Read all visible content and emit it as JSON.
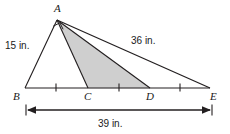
{
  "figure": {
    "type": "geometry-diagram",
    "colors": {
      "stroke": "#231f20",
      "shade_fill": "#cfcfcf",
      "background": "#ffffff",
      "text": "#1a1a1a"
    },
    "vertices": [
      {
        "id": "A",
        "label": "A",
        "x": 57,
        "y": 20
      },
      {
        "id": "B",
        "label": "B",
        "x": 25,
        "y": 88
      },
      {
        "id": "C",
        "label": "C",
        "x": 88,
        "y": 88
      },
      {
        "id": "D",
        "label": "D",
        "x": 150,
        "y": 88
      },
      {
        "id": "E",
        "label": "E",
        "x": 210,
        "y": 88
      }
    ],
    "vertex_labels": [
      {
        "name": "vertex-label-A",
        "text": "A",
        "x": 54,
        "y": 3
      },
      {
        "name": "vertex-label-B",
        "text": "B",
        "x": 13,
        "y": 91
      },
      {
        "name": "vertex-label-C",
        "text": "C",
        "x": 84,
        "y": 91
      },
      {
        "name": "vertex-label-D",
        "text": "D",
        "x": 146,
        "y": 91
      },
      {
        "name": "vertex-label-E",
        "text": "E",
        "x": 210,
        "y": 91
      }
    ],
    "segments": [
      {
        "name": "side-AB",
        "from": "A",
        "to": "B"
      },
      {
        "name": "side-AE",
        "from": "A",
        "to": "E"
      },
      {
        "name": "base-BE",
        "from": "B",
        "to": "E"
      },
      {
        "name": "cevian-AC",
        "from": "A",
        "to": "C"
      },
      {
        "name": "cevian-AD",
        "from": "A",
        "to": "D"
      }
    ],
    "shaded_region": {
      "name": "shaded-triangle-ACD",
      "vertices": [
        "A",
        "C",
        "D"
      ],
      "fill": "#cfcfcf"
    },
    "right_angle": {
      "name": "right-angle-mark-A",
      "at": "A",
      "between": [
        "AB",
        "AE"
      ]
    },
    "tick_marks": [
      {
        "name": "tick-mark-BC",
        "x": 56
      },
      {
        "name": "tick-mark-CD",
        "x": 119
      },
      {
        "name": "tick-mark-DE",
        "x": 180
      }
    ],
    "measure_labels": [
      {
        "name": "measure-label-AB",
        "text": "15 in.",
        "x": 5,
        "y": 41
      },
      {
        "name": "measure-label-AE",
        "text": "36 in.",
        "x": 131,
        "y": 36
      },
      {
        "name": "measure-label-BE",
        "text": "39 in.",
        "x": 98,
        "y": 119
      }
    ],
    "dimension_line": {
      "name": "dimension-line-BE",
      "x1": 26,
      "x2": 212,
      "y": 110,
      "measure": "39 in."
    }
  }
}
